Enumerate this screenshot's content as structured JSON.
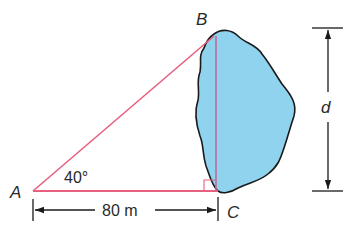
{
  "diagram": {
    "type": "right-triangle-lake-width",
    "points": {
      "A": {
        "label": "A",
        "x": 33,
        "y": 191
      },
      "B": {
        "label": "B",
        "x": 215,
        "y": 36
      },
      "C": {
        "label": "C",
        "x": 218,
        "y": 191
      }
    },
    "angle_A": {
      "label": "40°",
      "value_deg": 40
    },
    "base_length": {
      "label": "80 m",
      "value": 80,
      "unit": "m"
    },
    "unknown": {
      "label": "d"
    },
    "colors": {
      "triangle_line": "#e8607f",
      "lake_fill": "#8fd3ef",
      "lake_outline": "#1a1a1a",
      "dimension_line": "#1a1a1a",
      "vertical_leg": "#c06b9b"
    }
  }
}
